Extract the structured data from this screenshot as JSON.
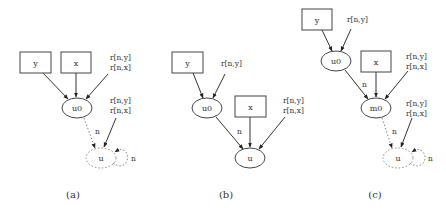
{
  "figure": {
    "panels": [
      {
        "caption": "(a)",
        "nodes": {
          "y": "y",
          "x": "x",
          "u0": "u0",
          "u": "u"
        },
        "annotations": {
          "top": [
            "r[n,y]",
            "r[n,x]"
          ],
          "mid": [
            "r[n,y]",
            "r[n,x]"
          ]
        },
        "edge_labels": {
          "u0_to_u": "n",
          "self_loop": "n"
        }
      },
      {
        "caption": "(b)",
        "nodes": {
          "y": "y",
          "x": "x",
          "u0": "u0",
          "u": "u"
        },
        "annotations": {
          "top": [
            "r[n,y]"
          ],
          "mid": [
            "r[n,y]",
            "r[n,x]"
          ]
        },
        "edge_labels": {
          "u0_to_u": "n"
        }
      },
      {
        "caption": "(c)",
        "nodes": {
          "y": "y",
          "x": "x",
          "u0": "u0",
          "m0": "m0",
          "u": "u"
        },
        "annotations": {
          "top": [
            "r[n,y]"
          ],
          "mid": [
            "r[n,y]",
            "r[n,x]"
          ],
          "low": [
            "r[n,y]",
            "r[n,x]"
          ]
        },
        "edge_labels": {
          "u0_to_m0": "n",
          "m0_to_u": "n",
          "self_loop": "n"
        }
      }
    ]
  }
}
